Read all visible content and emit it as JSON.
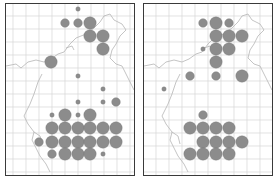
{
  "figure": {
    "panels": [
      {
        "id": "left",
        "frame": {
          "x": 5,
          "y": 3,
          "w": 130,
          "h": 173
        },
        "circles": [
          {
            "x": 77,
            "y": 8,
            "size": "small"
          },
          {
            "x": 64,
            "y": 22,
            "size": "medium"
          },
          {
            "x": 77,
            "y": 22,
            "size": "medium"
          },
          {
            "x": 89,
            "y": 22,
            "size": "large"
          },
          {
            "x": 89,
            "y": 35,
            "size": "large"
          },
          {
            "x": 102,
            "y": 35,
            "size": "large"
          },
          {
            "x": 102,
            "y": 48,
            "size": "large"
          },
          {
            "x": 50,
            "y": 61,
            "size": "large"
          },
          {
            "x": 77,
            "y": 75,
            "size": "small"
          },
          {
            "x": 102,
            "y": 88,
            "size": "small"
          },
          {
            "x": 77,
            "y": 101,
            "size": "small"
          },
          {
            "x": 102,
            "y": 101,
            "size": "small"
          },
          {
            "x": 115,
            "y": 101,
            "size": "medium"
          },
          {
            "x": 51,
            "y": 114,
            "size": "small"
          },
          {
            "x": 64,
            "y": 114,
            "size": "large"
          },
          {
            "x": 77,
            "y": 114,
            "size": "small"
          },
          {
            "x": 89,
            "y": 114,
            "size": "large"
          },
          {
            "x": 51,
            "y": 127,
            "size": "large"
          },
          {
            "x": 64,
            "y": 127,
            "size": "large"
          },
          {
            "x": 77,
            "y": 127,
            "size": "large"
          },
          {
            "x": 89,
            "y": 127,
            "size": "large"
          },
          {
            "x": 102,
            "y": 127,
            "size": "large"
          },
          {
            "x": 115,
            "y": 127,
            "size": "large"
          },
          {
            "x": 38,
            "y": 141,
            "size": "medium"
          },
          {
            "x": 51,
            "y": 141,
            "size": "large"
          },
          {
            "x": 64,
            "y": 141,
            "size": "large"
          },
          {
            "x": 77,
            "y": 141,
            "size": "large"
          },
          {
            "x": 89,
            "y": 141,
            "size": "large"
          },
          {
            "x": 102,
            "y": 141,
            "size": "large"
          },
          {
            "x": 115,
            "y": 141,
            "size": "large"
          },
          {
            "x": 51,
            "y": 153,
            "size": "medium"
          },
          {
            "x": 64,
            "y": 153,
            "size": "large"
          },
          {
            "x": 77,
            "y": 153,
            "size": "large"
          },
          {
            "x": 89,
            "y": 153,
            "size": "large"
          },
          {
            "x": 102,
            "y": 153,
            "size": "small"
          }
        ]
      },
      {
        "id": "right",
        "frame": {
          "x": 143,
          "y": 3,
          "w": 130,
          "h": 173
        },
        "circles": [
          {
            "x": 202,
            "y": 22,
            "size": "medium"
          },
          {
            "x": 215,
            "y": 22,
            "size": "large"
          },
          {
            "x": 228,
            "y": 22,
            "size": "medium"
          },
          {
            "x": 215,
            "y": 35,
            "size": "large"
          },
          {
            "x": 228,
            "y": 35,
            "size": "large"
          },
          {
            "x": 241,
            "y": 35,
            "size": "large"
          },
          {
            "x": 202,
            "y": 48,
            "size": "small"
          },
          {
            "x": 215,
            "y": 48,
            "size": "large"
          },
          {
            "x": 228,
            "y": 48,
            "size": "large"
          },
          {
            "x": 215,
            "y": 61,
            "size": "large"
          },
          {
            "x": 189,
            "y": 75,
            "size": "medium"
          },
          {
            "x": 215,
            "y": 75,
            "size": "medium"
          },
          {
            "x": 241,
            "y": 75,
            "size": "large"
          },
          {
            "x": 163,
            "y": 88,
            "size": "small"
          },
          {
            "x": 202,
            "y": 114,
            "size": "medium"
          },
          {
            "x": 189,
            "y": 127,
            "size": "large"
          },
          {
            "x": 202,
            "y": 127,
            "size": "large"
          },
          {
            "x": 215,
            "y": 127,
            "size": "large"
          },
          {
            "x": 228,
            "y": 127,
            "size": "large"
          },
          {
            "x": 202,
            "y": 141,
            "size": "large"
          },
          {
            "x": 215,
            "y": 141,
            "size": "large"
          },
          {
            "x": 228,
            "y": 141,
            "size": "large"
          },
          {
            "x": 241,
            "y": 141,
            "size": "large"
          },
          {
            "x": 189,
            "y": 153,
            "size": "large"
          },
          {
            "x": 202,
            "y": 153,
            "size": "large"
          },
          {
            "x": 215,
            "y": 153,
            "size": "large"
          },
          {
            "x": 228,
            "y": 153,
            "size": "large"
          }
        ]
      }
    ],
    "grid_spacing": 13,
    "radii": {
      "small": 2.2,
      "medium": 4.3,
      "large": 6.2
    },
    "colors": {
      "circle": "#8c8c8c",
      "circle_stroke": "#7a7a7a",
      "grid": "#d6d6d6",
      "coast": "#b5b5b5",
      "frame": "#3a3a3a",
      "background": "#ffffff"
    }
  }
}
